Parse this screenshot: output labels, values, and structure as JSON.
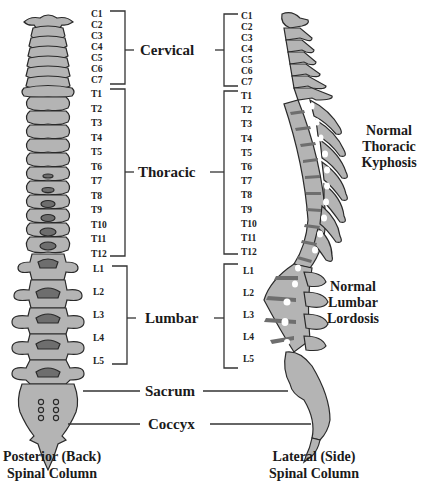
{
  "posterior": {
    "cervical_labels": [
      "C1",
      "C2",
      "C3",
      "C4",
      "C5",
      "C6",
      "C7"
    ],
    "thoracic_labels": [
      "T1",
      "T2",
      "T3",
      "T4",
      "T5",
      "T6",
      "T7",
      "T8",
      "T9",
      "T10",
      "T11",
      "T12"
    ],
    "lumbar_labels": [
      "L1",
      "L2",
      "L3",
      "L4",
      "L5"
    ],
    "caption_line1": "Posterior (Back)",
    "caption_line2": "Spinal Column"
  },
  "lateral": {
    "cervical_labels": [
      "C1",
      "C2",
      "C3",
      "C4",
      "C5",
      "C6",
      "C7"
    ],
    "thoracic_labels": [
      "T1",
      "T2",
      "T3",
      "T4",
      "T5",
      "T6",
      "T7",
      "T8",
      "T9",
      "T10",
      "T11",
      "T12"
    ],
    "lumbar_labels": [
      "L1",
      "L2",
      "L3",
      "L4",
      "L5"
    ],
    "caption_line1": "Lateral (Side)",
    "caption_line2": "Spinal Column",
    "kyphosis_line1": "Normal",
    "kyphosis_line2": "Thoracic",
    "kyphosis_line3": "Kyphosis",
    "lordosis_line1": "Normal",
    "lordosis_line2": "Lumbar",
    "lordosis_line3": "Lordosis"
  },
  "regions": {
    "cervical": "Cervical",
    "thoracic": "Thoracic",
    "lumbar": "Lumbar",
    "sacrum": "Sacrum",
    "coccyx": "Coccyx"
  },
  "colors": {
    "bone": "#b4b4b4",
    "disc": "#6e6e6e",
    "outline": "#2a2a2a",
    "background": "#ffffff"
  }
}
